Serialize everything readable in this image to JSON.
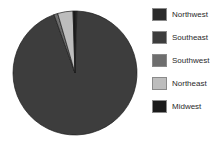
{
  "chart_data": {
    "type": "pie",
    "title": "",
    "labels": [
      "Northwest",
      "Southeast",
      "Southwest",
      "Northeast",
      "Midwest"
    ],
    "values": [
      0.5,
      94.0,
      1.0,
      4.0,
      0.5
    ],
    "colors": [
      "#2b2b2b",
      "#3d3d3d",
      "#6e6e6e",
      "#bdbdbd",
      "#1a1a1a"
    ],
    "start_angle_deg": 0,
    "direction": "clockwise",
    "legend_position": "right",
    "grid": false,
    "value_labels_shown": false
  },
  "legend": {
    "entries": [
      {
        "label": "Northwest",
        "color": "#2b2b2b"
      },
      {
        "label": "Southeast",
        "color": "#3d3d3d"
      },
      {
        "label": "Southwest",
        "color": "#6e6e6e"
      },
      {
        "label": "Northeast",
        "color": "#bdbdbd"
      },
      {
        "label": "Midwest",
        "color": "#1a1a1a"
      }
    ]
  },
  "style": {
    "background": "#ffffff",
    "slice_outline": "#1d1d1d",
    "swatch_border": "#8a8a8a",
    "text_color": "#2a2a2a"
  }
}
